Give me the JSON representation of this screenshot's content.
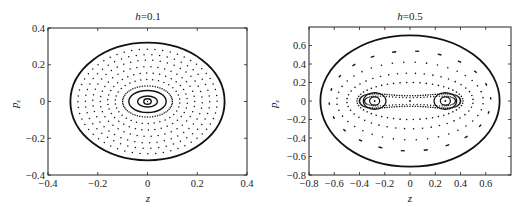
{
  "chart_data": [
    {
      "type": "scatter",
      "title_var": "h",
      "title_val": "=0.1",
      "title": "h=0.1",
      "xlabel": "z",
      "ylabel": "p_z",
      "xlim": [
        -0.4,
        0.4
      ],
      "ylim": [
        -0.4,
        0.4
      ],
      "xticks": [
        -0.4,
        -0.2,
        0,
        0.2,
        0.4
      ],
      "xtick_labels": [
        "−0.4",
        "−0.2",
        "0",
        "0.2",
        "0.4"
      ],
      "yticks": [
        -0.4,
        -0.2,
        0,
        0.2,
        0.4
      ],
      "ytick_labels": [
        "−0.4",
        "−0.2",
        "0",
        "0.2",
        "0.4"
      ],
      "grid": false,
      "boundary": {
        "rx": 0.31,
        "ry": 0.32
      },
      "solid_orbits": [
        {
          "rx": 0.015,
          "ry": 0.015
        },
        {
          "rx": 0.04,
          "ry": 0.03
        },
        {
          "rx": 0.075,
          "ry": 0.06
        }
      ],
      "dotted_orbits": [
        {
          "rx": 0.1,
          "ry": 0.085,
          "n": 60
        },
        {
          "rx": 0.13,
          "ry": 0.12,
          "n": 34
        },
        {
          "rx": 0.16,
          "ry": 0.155,
          "n": 38
        },
        {
          "rx": 0.19,
          "ry": 0.19,
          "n": 42
        },
        {
          "rx": 0.22,
          "ry": 0.225,
          "n": 46
        },
        {
          "rx": 0.25,
          "ry": 0.255,
          "n": 50
        },
        {
          "rx": 0.28,
          "ry": 0.285,
          "n": 56
        }
      ]
    },
    {
      "type": "scatter",
      "title_var": "h",
      "title_val": "=0.5",
      "title": "h=0.5",
      "xlabel": "z",
      "ylabel": "p_z",
      "xlim": [
        -0.8,
        0.8
      ],
      "ylim": [
        -0.8,
        0.8
      ],
      "xticks": [
        -0.8,
        -0.6,
        -0.4,
        -0.2,
        0,
        0.2,
        0.4,
        0.6
      ],
      "xtick_labels": [
        "−0.8",
        "−0.6",
        "−0.4",
        "−0.2",
        "0",
        "0.2",
        "0.4",
        "0.6"
      ],
      "yticks": [
        -0.8,
        -0.6,
        -0.4,
        -0.2,
        0,
        0.2,
        0.4,
        0.6
      ],
      "ytick_labels": [
        "−0.8",
        "−0.6",
        "−0.4",
        "−0.2",
        "0",
        "0.2",
        "0.4",
        "0.6"
      ],
      "grid": false,
      "boundary": {
        "rx": 0.71,
        "ry": 0.71
      },
      "fixed_points": [
        [
          -0.28,
          0
        ],
        [
          0.28,
          0
        ],
        [
          0,
          0
        ]
      ],
      "islands": [
        {
          "cx": -0.28,
          "rx": 0.04,
          "ry": 0.045
        },
        {
          "cx": 0.28,
          "rx": 0.04,
          "ry": 0.045
        },
        {
          "cx": -0.28,
          "rx": 0.09,
          "ry": 0.09
        },
        {
          "cx": 0.28,
          "rx": 0.09,
          "ry": 0.09
        }
      ],
      "outer_orbits": [
        {
          "rx": 0.42,
          "ry": 0.2,
          "n": 50
        },
        {
          "rx": 0.5,
          "ry": 0.3,
          "n": 44
        },
        {
          "rx": 0.58,
          "ry": 0.42,
          "n": 40
        },
        {
          "rx": 0.64,
          "ry": 0.54,
          "n": 22
        }
      ]
    }
  ],
  "panels": [
    {
      "title_var": "h",
      "title_val": "=0.1",
      "xlabel": "z",
      "ylabel": "p",
      "ylabel_sub": "z"
    },
    {
      "title_var": "h",
      "title_val": "=0.5",
      "xlabel": "z",
      "ylabel": "p",
      "ylabel_sub": "z"
    }
  ]
}
